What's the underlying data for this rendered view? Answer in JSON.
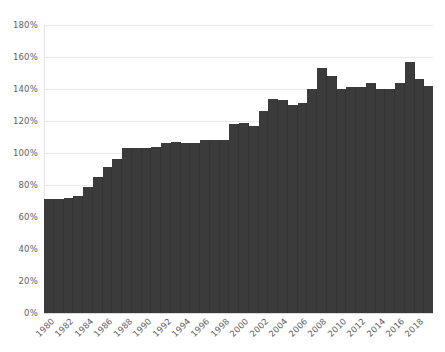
{
  "chart_data": {
    "type": "bar",
    "title": "",
    "subtitle": "",
    "xlabel": "",
    "ylabel": "",
    "ylim": [
      0,
      180
    ],
    "ytick_labels": [
      "180%",
      "160%",
      "140%",
      "120%",
      "100%",
      "80%",
      "60%",
      "40%",
      "20%",
      "0%"
    ],
    "ytick_values": [
      180,
      160,
      140,
      120,
      100,
      80,
      60,
      40,
      20,
      0
    ],
    "grid": true,
    "legend": "none",
    "bar_color": "#3b3b3b",
    "grid_color": "#e8e8e8",
    "background_color": "#ffffff",
    "xtick_labels": [
      "1980",
      "1982",
      "1984",
      "1986",
      "1988",
      "1990",
      "1992",
      "1994",
      "1996",
      "1998",
      "2000",
      "2002",
      "2004",
      "2006",
      "2008",
      "2010",
      "2012",
      "2014",
      "2016",
      "2018"
    ],
    "categories": [
      "1980",
      "1981",
      "1982",
      "1983",
      "1984",
      "1985",
      "1986",
      "1987",
      "1988",
      "1989",
      "1990",
      "1991",
      "1992",
      "1993",
      "1994",
      "1995",
      "1996",
      "1997",
      "1998",
      "1999",
      "2000",
      "2001",
      "2002",
      "2003",
      "2004",
      "2005",
      "2006",
      "2007",
      "2008",
      "2009",
      "2010",
      "2011",
      "2012",
      "2013",
      "2014",
      "2015",
      "2016",
      "2017",
      "2018",
      "2019"
    ],
    "values": [
      71,
      71,
      72,
      73,
      79,
      85,
      91,
      96,
      103,
      103,
      103,
      104,
      106,
      107,
      106,
      106,
      108,
      108,
      108,
      118,
      119,
      117,
      126,
      134,
      133,
      130,
      131,
      140,
      153,
      148,
      140,
      141,
      141,
      144,
      140,
      140,
      144,
      157,
      146,
      142
    ]
  }
}
